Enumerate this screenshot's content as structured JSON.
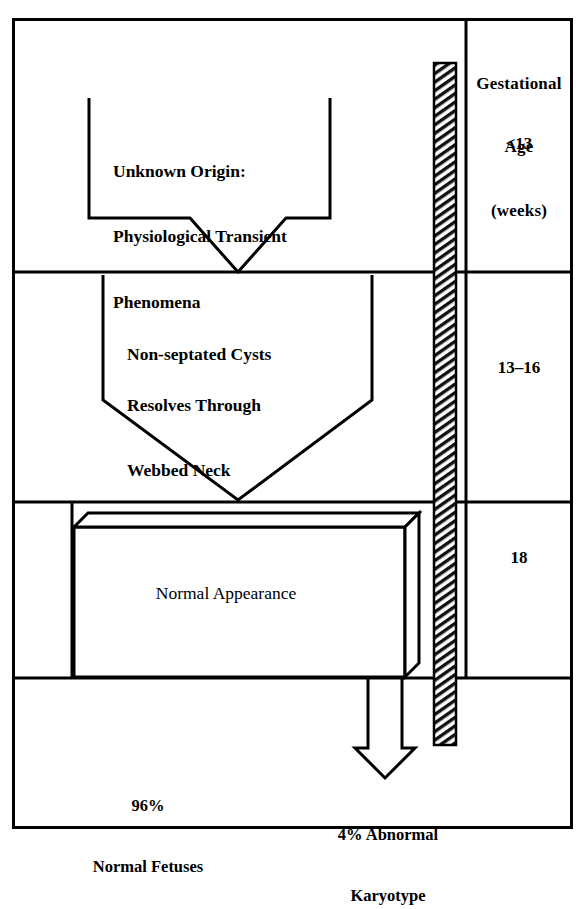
{
  "figure": {
    "type": "flow-diagram",
    "frame": {
      "border_color": "#000000",
      "background": "#ffffff"
    }
  },
  "right_column": {
    "header_lines": [
      "Gestational",
      "Age",
      "(weeks)"
    ],
    "rows": [
      {
        "age_label": "<13"
      },
      {
        "age_label": "13–16"
      },
      {
        "age_label": "18"
      },
      {
        "age_label": ""
      }
    ]
  },
  "stages": [
    {
      "id": "stage-unknown-origin",
      "shape": "funnel",
      "gestational_age": "<13",
      "lines": [
        "Unknown Origin:",
        "Physiological Transient",
        "Phenomena"
      ]
    },
    {
      "id": "stage-non-septated-cysts",
      "shape": "pentagon",
      "gestational_age": "13–16",
      "lines": [
        "Non-septated Cysts",
        "Resolves Through",
        "Webbed Neck"
      ],
      "line_styles": [
        "bold",
        "bold",
        "bold"
      ]
    },
    {
      "id": "stage-normal-appearance",
      "shape": "3d-box",
      "gestational_age": "18",
      "lines": [
        "Normal Appearance"
      ]
    }
  ],
  "outcomes": [
    {
      "id": "outcome-normal",
      "lines": [
        "96%",
        "Normal Fetuses"
      ],
      "percent": 96
    },
    {
      "id": "outcome-abnormal",
      "lines": [
        "4% Abnormal",
        "Karyotype"
      ],
      "percent": 4
    }
  ],
  "hatched_bar": {
    "name": "abnormal-karyotype-bar",
    "pattern": "diagonal-hatch",
    "color": "#000000"
  },
  "arrow": {
    "name": "downward-outline-arrow",
    "direction": "down",
    "style": "outline"
  }
}
